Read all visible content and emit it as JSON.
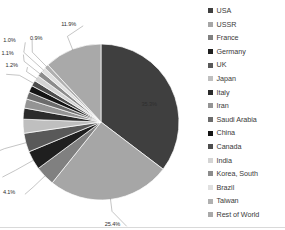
{
  "chart_data": {
    "type": "pie",
    "title": "",
    "legend_position": "right",
    "start_angle_deg": 0,
    "direction": "clockwise",
    "categories": [
      "USA",
      "USSR",
      "France",
      "Germany",
      "UK",
      "Japan",
      "Italy",
      "Iran",
      "Saudi Arabia",
      "China",
      "Canada",
      "India",
      "Korea, South",
      "Brazil",
      "Taiwan",
      "Rest of World"
    ],
    "values": [
      35.3,
      25.4,
      4.1,
      3.9,
      3.9,
      2.9,
      2.3,
      1.9,
      1.5,
      1.4,
      1.2,
      1.2,
      1.1,
      1.0,
      0.9,
      11.9
    ],
    "value_labels": [
      "35.3%",
      "25.4%",
      "4.1%",
      "3.9%",
      "3.9%",
      "2.9%",
      "2.3%",
      "1.9%",
      "1.5%",
      "1.4%",
      "1.2%",
      "1.2%",
      "1.1%",
      "1.0%",
      "0.9%",
      "11.9%"
    ],
    "colors": [
      "#3f3f3f",
      "#a6a6a6",
      "#808080",
      "#1f1f1f",
      "#595959",
      "#bfbfbf",
      "#2b2b2b",
      "#949494",
      "#6b6b6b",
      "#141414",
      "#4d4d4d",
      "#d4d4d4",
      "#8c8c8c",
      "#e0e0e0",
      "#b0b0b0",
      "#a9a9a9"
    ],
    "unit": "%"
  },
  "legend": {
    "items": [
      {
        "label": "USA",
        "color": "#3f3f3f"
      },
      {
        "label": "USSR",
        "color": "#a6a6a6"
      },
      {
        "label": "France",
        "color": "#808080"
      },
      {
        "label": "Germany",
        "color": "#1f1f1f"
      },
      {
        "label": "UK",
        "color": "#595959"
      },
      {
        "label": "Japan",
        "color": "#bfbfbf"
      },
      {
        "label": "Italy",
        "color": "#2b2b2b"
      },
      {
        "label": "Iran",
        "color": "#949494"
      },
      {
        "label": "Saudi Arabia",
        "color": "#6b6b6b"
      },
      {
        "label": "China",
        "color": "#141414"
      },
      {
        "label": "Canada",
        "color": "#4d4d4d"
      },
      {
        "label": "India",
        "color": "#d4d4d4"
      },
      {
        "label": "Korea, South",
        "color": "#8c8c8c"
      },
      {
        "label": "Brazil",
        "color": "#e0e0e0"
      },
      {
        "label": "Taiwan",
        "color": "#b0b0b0"
      },
      {
        "label": "Rest of World",
        "color": "#a9a9a9"
      }
    ]
  }
}
